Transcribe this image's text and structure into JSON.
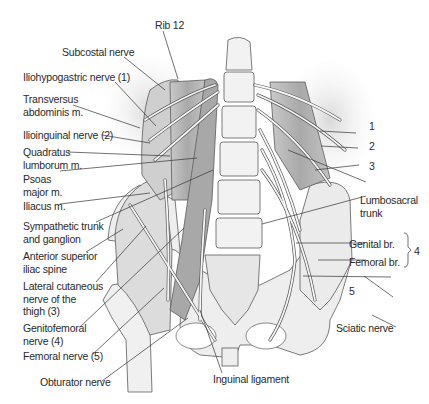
{
  "figure": {
    "colors": {
      "muscle": "#b9b9b9",
      "muscle_dark": "#8e8e8e",
      "bone": "#eeeeee",
      "outline": "#5a5a5a",
      "nerve": "#f4f4f4",
      "leader": "#333333",
      "text": "#2a2a2a"
    }
  },
  "labels": {
    "rib12": "Rib 12",
    "subcostal_nerve": "Subcostal nerve",
    "iliohypogastric_nerve": "Iliohypogastric nerve (1)",
    "transversus_abdominis": "Transversus\nabdominis m.",
    "ilioinguinal_nerve": "Ilioinguinal nerve (2)",
    "quadratus_lumborum": "Quadratus\nlumborum m.",
    "psoas_major": "Psoas\nmajor m.",
    "iliacus": "Iliacus m.",
    "sympathetic_trunk": "Sympathetic trunk\nand ganglion",
    "asis": "Anterior superior\niliac spine",
    "lateral_cutaneous": "Lateral cutaneous\nnerve of the\nthigh (3)",
    "genitofemoral": "Genitofemoral\nnerve (4)",
    "femoral_nerve": "Femoral nerve (5)",
    "obturator_nerve": "Obturator nerve",
    "inguinal_ligament": "Inguinal ligament",
    "sciatic_nerve": "Sciatic nerve",
    "lumbosacral_trunk": "Lumbosacral\ntrunk",
    "genital_br": "Genital br.",
    "femoral_br": "Femoral br.",
    "num_1": "1",
    "num_2": "2",
    "num_3": "3",
    "num_4": "4",
    "num_5": "5"
  }
}
